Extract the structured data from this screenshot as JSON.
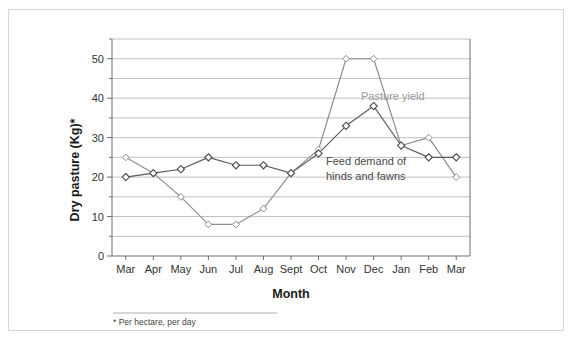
{
  "chart_data": {
    "type": "line",
    "title": "",
    "xlabel": "Month",
    "ylabel": "Dry pasture (Kg)*",
    "categories": [
      "Mar",
      "Apr",
      "May",
      "Jun",
      "Jul",
      "Aug",
      "Sept",
      "Oct",
      "Nov",
      "Dec",
      "Jan",
      "Feb",
      "Mar"
    ],
    "ylim": [
      0,
      55
    ],
    "yticks": [
      0,
      10,
      20,
      30,
      40,
      50
    ],
    "ytick_labels": [
      "0",
      "10",
      "20",
      "30",
      "40",
      "50"
    ],
    "gridlines": [
      0,
      5,
      10,
      15,
      20,
      25,
      30,
      35,
      40,
      45,
      50,
      55
    ],
    "grid": true,
    "legend_position": "inline-annotation",
    "series": [
      {
        "name": "Pasture yield",
        "color": "#8c8c8c",
        "values": [
          25,
          21,
          15,
          8,
          8,
          12,
          21,
          27,
          50,
          50,
          28,
          30,
          20
        ]
      },
      {
        "name": "Feed demand of hinds and fawns",
        "color": "#4a4a4a",
        "values": [
          20,
          21,
          22,
          25,
          23,
          23,
          21,
          26,
          33,
          38,
          28,
          25,
          25
        ]
      }
    ],
    "annotations": [
      {
        "text": "Pasture yield",
        "color": "#9a9a9a"
      },
      {
        "text": "Feed demand of",
        "color": "#4a4a4a"
      },
      {
        "text": "hinds and fawns",
        "color": "#4a4a4a"
      }
    ]
  },
  "footnote": {
    "text": "* Per hectare, per day"
  }
}
